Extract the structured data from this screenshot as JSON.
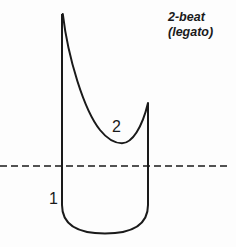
{
  "figure": {
    "name": "breath-curve-diagram",
    "background_color": "#fdfdfd",
    "stroke_color": "#1a1a1a",
    "width": 236,
    "height": 247
  },
  "caption": {
    "title": "2-beat",
    "subtitle": "(legato)"
  },
  "labels": {
    "beat_one": "1",
    "beat_two": "2"
  },
  "chart_data": {
    "type": "line",
    "title": "2-beat (legato)",
    "subtitle": "(legato)",
    "xlabel": "",
    "ylabel": "",
    "grid": false,
    "legend": "none",
    "annotations": [
      {
        "text": "1",
        "x": 54,
        "y": 199
      },
      {
        "text": "2",
        "x": 117,
        "y": 127
      },
      {
        "text": "2-beat",
        "x": 170,
        "y": 17
      },
      {
        "text": "(legato)",
        "x": 170,
        "y": 32
      }
    ],
    "baseline": {
      "style": "dashed",
      "y": 166,
      "x_start": 0,
      "x_end": 228,
      "dash_length": 7,
      "gap_length": 4,
      "color": "#1a1a1a"
    },
    "series": [
      {
        "name": "breath-envelope",
        "path": "M 62 14 L 62 205 C 62 226 80 233.5 105 233.5 C 130 233.5 148 226 148 205 L 148 103",
        "color": "#1a1a1a",
        "width": 2.0
      },
      {
        "name": "decay-curve",
        "path": "M 62.8 14 C 68 58 84 110 100 130 C 108 140 115 143.2 122 143.2 C 132 143.2 142 128 148 103",
        "color": "#1a1a1a",
        "width": 2.0
      }
    ],
    "key_points": {
      "apex": [
        62,
        14
      ],
      "trough": [
        122,
        143
      ],
      "right_top": [
        148,
        103
      ],
      "bottom": [
        105,
        233
      ],
      "left_vertical_x": 62,
      "right_vertical_x": 148,
      "vertical_bottom_y": 205
    }
  }
}
